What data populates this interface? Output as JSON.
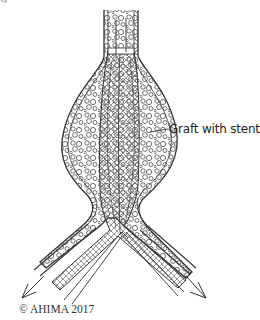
{
  "figure": {
    "title_fragment": "g                                   ",
    "callout_label": "Graft with stent",
    "copyright": "© AHIMA 2017",
    "colors": {
      "line": "#333333",
      "mesh": "#555555",
      "fill": "#ffffff"
    }
  }
}
